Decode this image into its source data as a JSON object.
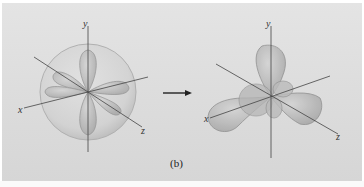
{
  "figure": {
    "caption": "(b)",
    "left_diagram": {
      "description": "d-orbital lobes inside a transparent sphere",
      "axis_labels": {
        "x": "x",
        "y": "y",
        "z": "z"
      }
    },
    "arrow": {
      "direction": "right"
    },
    "right_diagram": {
      "description": "hybrid orbital lobes (trigonal arrangement)",
      "axis_labels": {
        "x": "x",
        "y": "y",
        "z": "z"
      }
    },
    "colors": {
      "background": "#dcdcdc",
      "lobe_fill": "#b8b8b8",
      "lobe_stroke": "#8a8a8a",
      "sphere_fill": "#d0d0d0",
      "axis": "#444444"
    }
  }
}
